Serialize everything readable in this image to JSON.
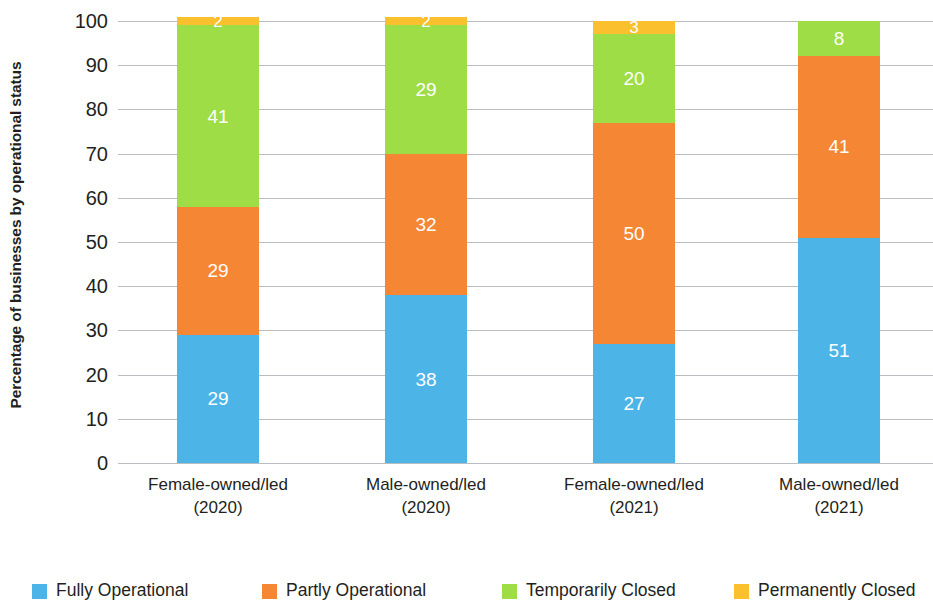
{
  "chart_data": {
    "type": "bar",
    "stacked": true,
    "title": "",
    "xlabel": "",
    "ylabel": "Percentage of businesses by operational status",
    "ylim": [
      0,
      100
    ],
    "ytick_labels": [
      "100",
      "90",
      "80",
      "70",
      "60",
      "50",
      "40",
      "30",
      "20",
      "10",
      "0"
    ],
    "ytick_values": [
      100,
      90,
      80,
      70,
      60,
      50,
      40,
      30,
      20,
      10,
      0
    ],
    "grid": true,
    "legend_position": "bottom",
    "categories": [
      "Female-owned/led (2020)",
      "Male-owned/led (2020)",
      "Female-owned/led (2021)",
      "Male-owned/led (2021)"
    ],
    "category_lines": [
      {
        "line1": "Female-owned/led",
        "line2": "(2020)"
      },
      {
        "line1": "Male-owned/led",
        "line2": "(2020)"
      },
      {
        "line1": "Female-owned/led",
        "line2": "(2021)"
      },
      {
        "line1": "Male-owned/led",
        "line2": "(2021)"
      }
    ],
    "series": [
      {
        "name": "Fully Operational",
        "color": "#4cb4e7",
        "values": [
          29,
          38,
          27,
          51
        ],
        "labels": [
          "29",
          "38",
          "27",
          "51"
        ]
      },
      {
        "name": "Partly Operational",
        "color": "#f58634",
        "values": [
          29,
          32,
          50,
          41
        ],
        "labels": [
          "29",
          "32",
          "50",
          "41"
        ]
      },
      {
        "name": "Temporarily Closed",
        "color": "#9edd46",
        "values": [
          41,
          29,
          20,
          8
        ],
        "labels": [
          "41",
          "29",
          "20",
          "8"
        ]
      },
      {
        "name": "Permanently Closed",
        "color": "#fbc02d",
        "values": [
          2,
          2,
          3,
          0
        ],
        "labels": [
          "2",
          "2",
          "3",
          ""
        ]
      }
    ]
  },
  "legend": {
    "items": [
      {
        "label": "Fully Operational",
        "color": "#4cb4e7"
      },
      {
        "label": "Partly Operational",
        "color": "#f58634"
      },
      {
        "label": "Temporarily Closed",
        "color": "#9edd46"
      },
      {
        "label": "Permanently Closed",
        "color": "#fbc02d"
      }
    ]
  },
  "axis": {
    "y_title": "Percentage of businesses by operational status"
  }
}
